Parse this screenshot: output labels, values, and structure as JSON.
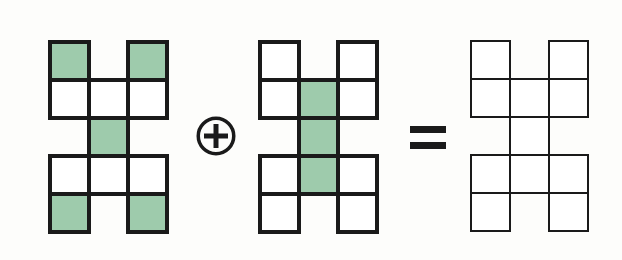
{
  "diagram": {
    "type": "polyomino-addition-equation",
    "background_color": "#fdfdfb",
    "fill_color": "#9ecbac",
    "empty_color": "#ffffff",
    "stroke_color": "#1a1a1a",
    "grid": {
      "columns": 3,
      "rows": 5,
      "cell_width": 39,
      "cell_height": 38,
      "mask": [
        [
          1,
          0,
          1
        ],
        [
          1,
          1,
          1
        ],
        [
          0,
          1,
          0
        ],
        [
          1,
          1,
          1
        ],
        [
          1,
          0,
          1
        ]
      ]
    },
    "shapes": [
      {
        "id": "shape-a",
        "label": "first-addend",
        "x": 48,
        "y": 40,
        "stroke_width": 4,
        "fill_map": [
          [
            1,
            0,
            1
          ],
          [
            0,
            0,
            0
          ],
          [
            0,
            1,
            0
          ],
          [
            0,
            0,
            0
          ],
          [
            1,
            0,
            1
          ]
        ],
        "filled_count": 5
      },
      {
        "id": "shape-b",
        "label": "second-addend",
        "x": 258,
        "y": 40,
        "stroke_width": 4,
        "fill_map": [
          [
            0,
            0,
            0
          ],
          [
            0,
            1,
            0
          ],
          [
            0,
            1,
            0
          ],
          [
            0,
            1,
            0
          ],
          [
            0,
            0,
            0
          ]
        ],
        "filled_count": 3
      },
      {
        "id": "shape-c",
        "label": "result",
        "x": 470,
        "y": 40,
        "stroke_width": 2,
        "fill_map": [
          [
            0,
            0,
            0
          ],
          [
            0,
            0,
            0
          ],
          [
            0,
            0,
            0
          ],
          [
            0,
            0,
            0
          ],
          [
            0,
            0,
            0
          ]
        ],
        "filled_count": 0
      }
    ],
    "operators": [
      {
        "id": "plus-operator",
        "symbol": "plus-in-circle",
        "x": 196,
        "y": 116,
        "size": 40,
        "stroke_width": 3.5,
        "color": "#1a1a1a"
      },
      {
        "id": "equals-operator",
        "symbol": "equals",
        "x": 410,
        "y": 126,
        "width": 36,
        "bar_height": 7,
        "bar_gap": 9,
        "color": "#1a1a1a"
      }
    ]
  }
}
